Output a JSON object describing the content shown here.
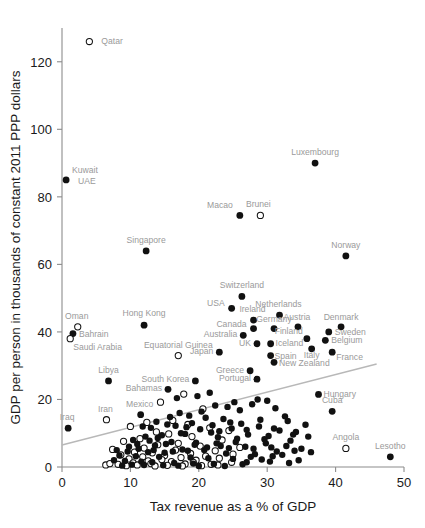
{
  "chart_data": {
    "type": "scatter",
    "title": "",
    "xlabel": "Tax revenue as a % of GDP",
    "ylabel": "GDP per person in thousands of constant 2011 PPP dollars",
    "xlim": [
      0,
      50
    ],
    "ylim": [
      0,
      130
    ],
    "xticks": [
      0,
      10,
      20,
      30,
      40,
      50
    ],
    "yticks": [
      0,
      20,
      40,
      60,
      80,
      100,
      120
    ],
    "grid": false,
    "legend": "none",
    "marker_styles": {
      "filled": "black filled circle",
      "open": "white open circle"
    },
    "trendline": {
      "x0": 0,
      "y0": 6.5,
      "x1": 46,
      "y1": 30.5,
      "color": "#b8b8b8"
    },
    "labeled_points": [
      {
        "name": "Qatar",
        "x": 4.0,
        "y": 126.0,
        "fill": "open",
        "lx": 12,
        "ly": 2,
        "anchor": "start"
      },
      {
        "name": "Kuwait",
        "x": 0.6,
        "y": 85.0,
        "fill": "filled",
        "lx": 6,
        "ly": -7,
        "anchor": "start"
      },
      {
        "name": "UAE",
        "x": 0.6,
        "y": 85.0,
        "fill": "none",
        "lx": 12,
        "ly": 4,
        "anchor": "start"
      },
      {
        "name": "Luxembourg",
        "x": 37.0,
        "y": 90.0,
        "fill": "filled",
        "lx": 0,
        "ly": -8,
        "anchor": "middle"
      },
      {
        "name": "Macao",
        "x": 26.0,
        "y": 74.5,
        "fill": "filled",
        "lx": -7,
        "ly": -7,
        "anchor": "end"
      },
      {
        "name": "Brunei",
        "x": 29.0,
        "y": 74.5,
        "fill": "open",
        "lx": -2,
        "ly": -8,
        "anchor": "middle"
      },
      {
        "name": "Singapore",
        "x": 12.3,
        "y": 64.0,
        "fill": "filled",
        "lx": 0,
        "ly": -8,
        "anchor": "middle"
      },
      {
        "name": "Norway",
        "x": 41.5,
        "y": 62.5,
        "fill": "filled",
        "lx": 0,
        "ly": -8,
        "anchor": "middle"
      },
      {
        "name": "Switzerland",
        "x": 26.3,
        "y": 50.5,
        "fill": "filled",
        "lx": 0,
        "ly": -8,
        "anchor": "middle"
      },
      {
        "name": "USA",
        "x": 24.8,
        "y": 47.0,
        "fill": "filled",
        "lx": -7,
        "ly": -2,
        "anchor": "end"
      },
      {
        "name": "Ireland",
        "x": 28.0,
        "y": 43.5,
        "fill": "filled",
        "lx": -1,
        "ly": -8,
        "anchor": "middle"
      },
      {
        "name": "Netherlands",
        "x": 31.8,
        "y": 45.0,
        "fill": "filled",
        "lx": -1,
        "ly": -8,
        "anchor": "middle"
      },
      {
        "name": "Oman",
        "x": 2.3,
        "y": 41.5,
        "fill": "open",
        "lx": -1,
        "ly": -8,
        "anchor": "middle"
      },
      {
        "name": "Bahrain",
        "x": 1.6,
        "y": 39.5,
        "fill": "filled",
        "lx": 6,
        "ly": 3,
        "anchor": "start"
      },
      {
        "name": "Saudi Arabia",
        "x": 1.2,
        "y": 38.0,
        "fill": "open",
        "lx": 3,
        "ly": 11,
        "anchor": "start"
      },
      {
        "name": "Hong Kong",
        "x": 12.0,
        "y": 42.0,
        "fill": "filled",
        "lx": 0,
        "ly": -9,
        "anchor": "middle"
      },
      {
        "name": "Canada",
        "x": 28.0,
        "y": 41.0,
        "fill": "filled",
        "lx": -7,
        "ly": -2,
        "anchor": "end"
      },
      {
        "name": "Germany",
        "x": 31.0,
        "y": 41.0,
        "fill": "filled",
        "lx": 0,
        "ly": -7,
        "anchor": "middle"
      },
      {
        "name": "Austria",
        "x": 34.5,
        "y": 41.5,
        "fill": "filled",
        "lx": -1,
        "ly": -7,
        "anchor": "middle"
      },
      {
        "name": "Denmark",
        "x": 40.8,
        "y": 41.5,
        "fill": "filled",
        "lx": 0,
        "ly": -7,
        "anchor": "middle"
      },
      {
        "name": "Sweden",
        "x": 39.0,
        "y": 40.0,
        "fill": "filled",
        "lx": 6,
        "ly": 3,
        "anchor": "start"
      },
      {
        "name": "Australia",
        "x": 26.5,
        "y": 39.0,
        "fill": "filled",
        "lx": -6,
        "ly": 2,
        "anchor": "end"
      },
      {
        "name": "Finland",
        "x": 35.8,
        "y": 38.0,
        "fill": "filled",
        "lx": -4,
        "ly": -5,
        "anchor": "end"
      },
      {
        "name": "Belgium",
        "x": 38.5,
        "y": 37.5,
        "fill": "filled",
        "lx": 6,
        "ly": 3,
        "anchor": "start"
      },
      {
        "name": "UK",
        "x": 28.5,
        "y": 36.5,
        "fill": "filled",
        "lx": -6,
        "ly": 2,
        "anchor": "end"
      },
      {
        "name": "Iceland",
        "x": 30.5,
        "y": 36.5,
        "fill": "filled",
        "lx": 5,
        "ly": 2,
        "anchor": "start"
      },
      {
        "name": "Italy",
        "x": 36.5,
        "y": 35.0,
        "fill": "filled",
        "lx": 0,
        "ly": 9,
        "anchor": "middle"
      },
      {
        "name": "France",
        "x": 39.5,
        "y": 34.0,
        "fill": "filled",
        "lx": 4,
        "ly": 8,
        "anchor": "start"
      },
      {
        "name": "Spain",
        "x": 30.5,
        "y": 33.0,
        "fill": "filled",
        "lx": 4,
        "ly": 3,
        "anchor": "start"
      },
      {
        "name": "New Zealand",
        "x": 31.0,
        "y": 31.0,
        "fill": "filled",
        "lx": 5,
        "ly": 4,
        "anchor": "start"
      },
      {
        "name": "Equatorial Guinea",
        "x": 17.0,
        "y": 33.0,
        "fill": "open",
        "lx": 0,
        "ly": -8,
        "anchor": "middle"
      },
      {
        "name": "Japan",
        "x": 23.0,
        "y": 34.0,
        "fill": "filled",
        "lx": -6,
        "ly": 2,
        "anchor": "end"
      },
      {
        "name": "Greece",
        "x": 27.5,
        "y": 28.5,
        "fill": "filled",
        "lx": -6,
        "ly": 2,
        "anchor": "end"
      },
      {
        "name": "Portugal",
        "x": 28.5,
        "y": 26.0,
        "fill": "filled",
        "lx": -6,
        "ly": 2,
        "anchor": "end"
      },
      {
        "name": "South Korea",
        "x": 19.5,
        "y": 25.5,
        "fill": "filled",
        "lx": -6,
        "ly": 1,
        "anchor": "end"
      },
      {
        "name": "Libya",
        "x": 6.8,
        "y": 25.5,
        "fill": "filled",
        "lx": 0,
        "ly": -8,
        "anchor": "middle"
      },
      {
        "name": "Bahamas",
        "x": 15.5,
        "y": 23.0,
        "fill": "filled",
        "lx": -6,
        "ly": 2,
        "anchor": "end"
      },
      {
        "name": "Hungary",
        "x": 37.5,
        "y": 21.5,
        "fill": "filled",
        "lx": 5,
        "ly": 3,
        "anchor": "start"
      },
      {
        "name": "Cuba",
        "x": 39.5,
        "y": 16.5,
        "fill": "filled",
        "lx": 0,
        "ly": -8,
        "anchor": "middle"
      },
      {
        "name": "Mexico",
        "x": 11.5,
        "y": 15.5,
        "fill": "filled",
        "lx": -1,
        "ly": -8,
        "anchor": "middle"
      },
      {
        "name": "Iran",
        "x": 6.5,
        "y": 14.0,
        "fill": "open",
        "lx": -1,
        "ly": -8,
        "anchor": "middle"
      },
      {
        "name": "Iraq",
        "x": 0.9,
        "y": 11.5,
        "fill": "filled",
        "lx": -1,
        "ly": -8,
        "anchor": "middle"
      },
      {
        "name": "Angola",
        "x": 41.5,
        "y": 5.5,
        "fill": "open",
        "lx": 0,
        "ly": -8,
        "anchor": "middle"
      },
      {
        "name": "Lesotho",
        "x": 48.0,
        "y": 3.0,
        "fill": "filled",
        "lx": 0,
        "ly": -8,
        "anchor": "middle"
      }
    ],
    "unlabeled_filled": [
      [
        28.6,
        20.0
      ],
      [
        30.0,
        19.6
      ],
      [
        25.2,
        19.2
      ],
      [
        27.8,
        18.6
      ],
      [
        22.4,
        18.2
      ],
      [
        24.2,
        17.8
      ],
      [
        31.2,
        17.4
      ],
      [
        26.0,
        16.8
      ],
      [
        20.4,
        16.4
      ],
      [
        17.2,
        16.0
      ],
      [
        18.6,
        15.2
      ],
      [
        21.0,
        14.6
      ],
      [
        23.6,
        14.2
      ],
      [
        29.0,
        14.0
      ],
      [
        33.0,
        13.6
      ],
      [
        19.0,
        13.0
      ],
      [
        15.4,
        12.6
      ],
      [
        16.6,
        12.2
      ],
      [
        13.0,
        11.6
      ],
      [
        24.8,
        11.4
      ],
      [
        27.0,
        11.0
      ],
      [
        31.8,
        10.8
      ],
      [
        34.2,
        10.4
      ],
      [
        21.8,
        10.2
      ],
      [
        18.0,
        9.8
      ],
      [
        14.6,
        9.4
      ],
      [
        12.2,
        9.0
      ],
      [
        22.8,
        8.8
      ],
      [
        25.6,
        8.4
      ],
      [
        29.6,
        8.2
      ],
      [
        33.4,
        7.8
      ],
      [
        16.0,
        7.4
      ],
      [
        19.6,
        7.2
      ],
      [
        11.0,
        6.8
      ],
      [
        13.6,
        6.4
      ],
      [
        23.2,
        6.2
      ],
      [
        26.8,
        6.0
      ],
      [
        30.6,
        5.8
      ],
      [
        35.0,
        5.4
      ],
      [
        17.6,
        5.2
      ],
      [
        20.8,
        5.0
      ],
      [
        9.6,
        4.6
      ],
      [
        12.6,
        4.4
      ],
      [
        15.0,
        4.2
      ],
      [
        24.0,
        4.0
      ],
      [
        28.2,
        3.8
      ],
      [
        32.2,
        3.6
      ],
      [
        8.4,
        3.4
      ],
      [
        10.8,
        3.2
      ],
      [
        14.2,
        3.0
      ],
      [
        18.8,
        2.8
      ],
      [
        21.4,
        2.6
      ],
      [
        25.0,
        2.4
      ],
      [
        29.2,
        2.2
      ],
      [
        7.6,
        2.0
      ],
      [
        9.2,
        1.8
      ],
      [
        11.6,
        1.6
      ],
      [
        13.2,
        1.4
      ],
      [
        16.4,
        1.2
      ],
      [
        19.2,
        1.0
      ],
      [
        22.2,
        0.9
      ],
      [
        26.4,
        0.8
      ],
      [
        10.2,
        0.7
      ],
      [
        12.0,
        0.6
      ],
      [
        14.8,
        0.5
      ],
      [
        17.0,
        0.4
      ],
      [
        8.8,
        0.4
      ],
      [
        20.0,
        0.3
      ],
      [
        23.8,
        0.3
      ],
      [
        30.8,
        3.2
      ],
      [
        27.6,
        3.0
      ],
      [
        34.6,
        2.0
      ],
      [
        36.0,
        9.0
      ],
      [
        35.6,
        12.5
      ],
      [
        32.6,
        15.0
      ],
      [
        16.8,
        20.4
      ],
      [
        19.8,
        21.0
      ],
      [
        21.6,
        22.0
      ],
      [
        18.2,
        11.8
      ],
      [
        15.8,
        14.8
      ],
      [
        13.8,
        13.4
      ],
      [
        11.8,
        12.0
      ],
      [
        24.6,
        13.2
      ],
      [
        22.0,
        12.4
      ],
      [
        26.2,
        12.8
      ],
      [
        28.8,
        12.0
      ],
      [
        31.0,
        11.4
      ],
      [
        33.8,
        9.6
      ],
      [
        30.2,
        9.2
      ],
      [
        27.2,
        9.6
      ],
      [
        23.0,
        10.6
      ],
      [
        20.2,
        11.2
      ],
      [
        17.4,
        10.0
      ],
      [
        14.0,
        8.6
      ],
      [
        10.4,
        8.0
      ],
      [
        12.8,
        7.8
      ],
      [
        15.2,
        6.8
      ],
      [
        19.4,
        6.6
      ],
      [
        22.6,
        7.0
      ],
      [
        25.4,
        7.4
      ],
      [
        29.8,
        7.0
      ],
      [
        32.8,
        6.2
      ],
      [
        36.4,
        4.4
      ],
      [
        34.0,
        4.8
      ],
      [
        31.4,
        4.6
      ],
      [
        28.0,
        5.4
      ],
      [
        24.4,
        5.6
      ],
      [
        21.2,
        5.8
      ],
      [
        18.4,
        4.8
      ],
      [
        16.2,
        4.6
      ],
      [
        13.4,
        5.0
      ],
      [
        11.2,
        5.4
      ],
      [
        9.8,
        6.0
      ],
      [
        8.0,
        5.0
      ],
      [
        30.4,
        1.6
      ],
      [
        27.0,
        1.4
      ],
      [
        33.2,
        1.2
      ]
    ],
    "unlabeled_open": [
      [
        17.8,
        21.6
      ],
      [
        14.4,
        19.2
      ],
      [
        20.6,
        17.2
      ],
      [
        16.2,
        13.8
      ],
      [
        12.4,
        13.2
      ],
      [
        18.4,
        12.6
      ],
      [
        10.0,
        12.0
      ],
      [
        21.6,
        11.6
      ],
      [
        24.4,
        10.8
      ],
      [
        13.8,
        10.4
      ],
      [
        15.6,
        9.8
      ],
      [
        19.0,
        9.0
      ],
      [
        11.4,
        8.4
      ],
      [
        23.4,
        8.0
      ],
      [
        9.0,
        7.6
      ],
      [
        17.0,
        7.0
      ],
      [
        14.0,
        6.6
      ],
      [
        20.2,
        6.2
      ],
      [
        26.0,
        5.8
      ],
      [
        12.0,
        5.6
      ],
      [
        7.4,
        5.2
      ],
      [
        16.6,
        5.0
      ],
      [
        22.4,
        4.8
      ],
      [
        10.6,
        4.4
      ],
      [
        13.2,
        4.2
      ],
      [
        18.8,
        4.0
      ],
      [
        25.0,
        3.8
      ],
      [
        8.6,
        3.6
      ],
      [
        15.0,
        3.4
      ],
      [
        21.0,
        3.2
      ],
      [
        11.8,
        3.0
      ],
      [
        17.4,
        2.8
      ],
      [
        23.0,
        2.6
      ],
      [
        9.8,
        2.4
      ],
      [
        14.6,
        2.2
      ],
      [
        19.6,
        2.0
      ],
      [
        12.6,
        1.8
      ],
      [
        16.0,
        1.6
      ],
      [
        24.8,
        1.4
      ],
      [
        10.4,
        1.2
      ],
      [
        13.0,
        1.0
      ],
      [
        18.0,
        0.9
      ],
      [
        21.8,
        0.8
      ],
      [
        8.2,
        0.8
      ],
      [
        11.0,
        0.6
      ],
      [
        15.4,
        0.5
      ],
      [
        20.4,
        0.4
      ],
      [
        17.6,
        0.3
      ],
      [
        13.6,
        0.3
      ],
      [
        9.4,
        0.4
      ],
      [
        22.8,
        0.6
      ],
      [
        19.2,
        1.4
      ],
      [
        6.4,
        0.6
      ],
      [
        7.0,
        1.0
      ]
    ]
  }
}
